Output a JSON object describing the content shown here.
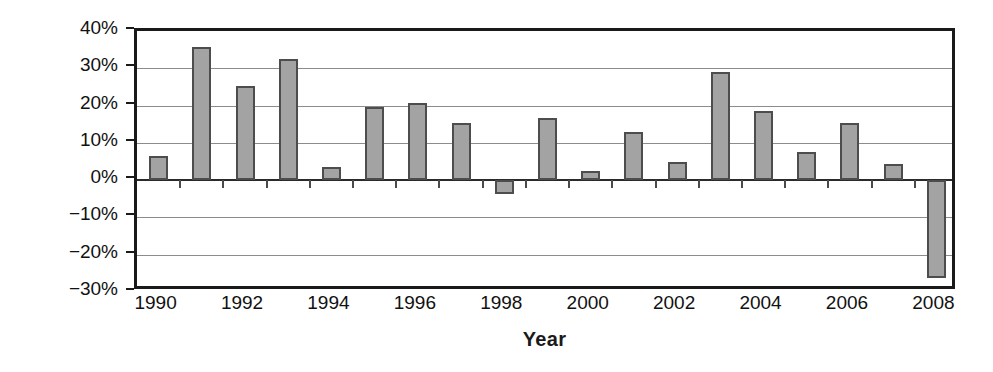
{
  "chart_data": {
    "type": "bar",
    "title": "",
    "xlabel": "Year",
    "ylabel": "Return",
    "categories": [
      "1990",
      "1991",
      "1992",
      "1993",
      "1994",
      "1995",
      "1996",
      "1997",
      "1998",
      "1999",
      "2000",
      "2001",
      "2002",
      "2003",
      "2004",
      "2005",
      "2006",
      "2007",
      "2008"
    ],
    "values": [
      6.4,
      35.8,
      25.3,
      32.5,
      3.5,
      19.7,
      20.8,
      15.4,
      -3.8,
      16.7,
      2.5,
      13.0,
      5.0,
      29.1,
      18.5,
      7.6,
      15.4,
      4.2,
      -26.2
    ],
    "ylim": [
      -30,
      40
    ],
    "ytick_values": [
      40,
      30,
      20,
      10,
      0,
      -10,
      -20,
      -30
    ],
    "ytick_labels": [
      "40%",
      "30%",
      "20%",
      "10%",
      "0%",
      "−10%",
      "−20%",
      "−30%"
    ],
    "xtick_labels": [
      "1990",
      "1992",
      "1994",
      "1996",
      "1998",
      "2000",
      "2002",
      "2004",
      "2006",
      "2008"
    ],
    "xtick_categories": [
      "1990",
      "1992",
      "1994",
      "1996",
      "1998",
      "2000",
      "2002",
      "2004",
      "2006",
      "2008"
    ],
    "grid": true,
    "legend": "none",
    "series_name": "Return",
    "bar_color": "#a3a3a3",
    "bar_border_color": "#4d4d4d",
    "gridline_color": "#8c8c8c",
    "axis_color": "#1a1a1a",
    "text_color": "#111111"
  }
}
